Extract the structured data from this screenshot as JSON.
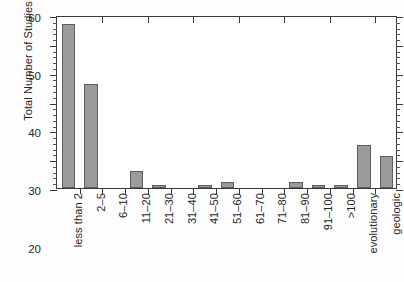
{
  "chart_data": {
    "type": "bar",
    "title": "",
    "xlabel": "",
    "ylabel": "Total Number of Studies",
    "ylim": [
      0,
      60
    ],
    "ytick_values": [
      0,
      10,
      20,
      30,
      40,
      50,
      60
    ],
    "ytick_labels": [
      "0",
      "10",
      "20",
      "30",
      "40",
      "50",
      "60"
    ],
    "ytick_minor_step": 2,
    "grid": false,
    "legend": null,
    "bar_color": "#9b9b9b",
    "bar_edge_color": "#5d5d5d",
    "axis_color": "#3a3a3a",
    "background_color": "#ffffff",
    "categories": [
      "less than 2",
      "2–5",
      "6–10",
      "11–20",
      "21–30",
      "31–40",
      "41–50",
      "51–60",
      "61–70",
      "71–80",
      "81–90",
      "91–100",
      ">100",
      "evolutionary",
      "geologic"
    ],
    "values": [
      57,
      36,
      0,
      6,
      1,
      0,
      1,
      2,
      0,
      0,
      2,
      1,
      1,
      15,
      11
    ]
  }
}
